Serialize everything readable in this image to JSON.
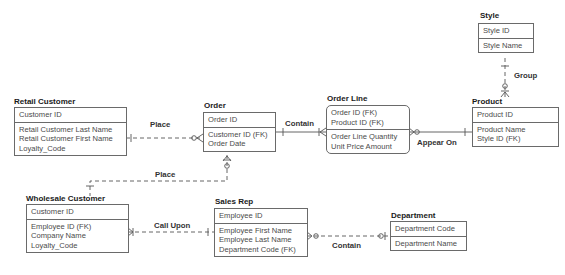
{
  "entities": {
    "style": {
      "title": "Style",
      "key_attributes": [
        "Style ID"
      ],
      "attributes": [
        "Style Name"
      ]
    },
    "product": {
      "title": "Product",
      "key_attributes": [
        "Product ID"
      ],
      "attributes": [
        "Product Name",
        "Style ID (FK)"
      ]
    },
    "retail_customer": {
      "title": "Retail Customer",
      "key_attributes": [
        "Customer ID"
      ],
      "attributes": [
        "Retail Customer Last Name",
        "Retail Customer First Name",
        "Loyalty_Code"
      ]
    },
    "order": {
      "title": "Order",
      "key_attributes": [
        "Order ID"
      ],
      "attributes": [
        "Customer ID (FK)",
        "Order Date"
      ]
    },
    "order_line": {
      "title": "Order Line",
      "key_attributes": [
        "Order ID (FK)",
        "Product ID (FK)"
      ],
      "attributes": [
        "Order Line Quantity",
        "Unit Price Amount"
      ]
    },
    "wholesale_customer": {
      "title": "Wholesale Customer",
      "key_attributes": [
        "Customer ID"
      ],
      "attributes": [
        "Employee ID (FK)",
        "Company Name",
        "Loyalty_Code"
      ]
    },
    "sales_rep": {
      "title": "Sales Rep",
      "key_attributes": [
        "Employee ID"
      ],
      "attributes": [
        "Employee First Name",
        "Employee Last Name",
        "Department Code (FK)"
      ]
    },
    "department": {
      "title": "Department",
      "key_attributes": [
        "Department Code"
      ],
      "attributes": [
        "Department Name"
      ]
    }
  },
  "relationships": {
    "group": {
      "label": "Group",
      "from": "Style",
      "to": "Product"
    },
    "place_retail": {
      "label": "Place",
      "from": "Retail Customer",
      "to": "Order"
    },
    "contain_order": {
      "label": "Contain",
      "from": "Order",
      "to": "Order Line"
    },
    "appear_on": {
      "label": "Appear On",
      "from": "Product",
      "to": "Order Line"
    },
    "place_wholesale": {
      "label": "Place",
      "from": "Wholesale Customer",
      "to": "Order"
    },
    "call_upon": {
      "label": "Call Upon",
      "from": "Sales Rep",
      "to": "Wholesale Customer"
    },
    "contain_department": {
      "label": "Contain",
      "from": "Department",
      "to": "Sales Rep"
    }
  }
}
